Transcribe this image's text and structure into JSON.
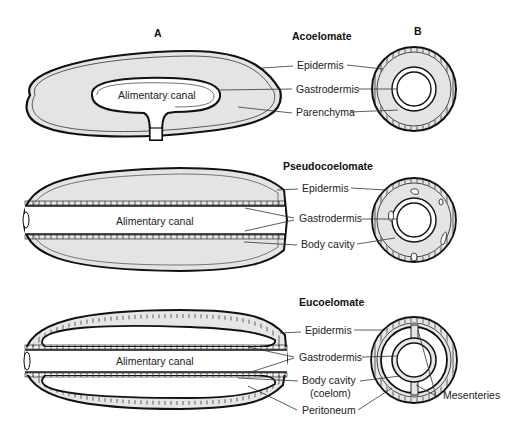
{
  "columns": {
    "a": "A",
    "b": "B"
  },
  "panels": [
    {
      "title": "Acoelomate",
      "canal_label": "Alimentary canal",
      "labels": [
        "Epidermis",
        "Gastrodermis",
        "Parenchyma"
      ]
    },
    {
      "title": "Pseudocoelomate",
      "canal_label": "Alimentary canal",
      "labels": [
        "Epidermis",
        "Gastrodermis",
        "Body cavity"
      ]
    },
    {
      "title": "Eucoelomate",
      "canal_label": "Alimentary canal",
      "labels": [
        "Epidermis",
        "Gastrodermis",
        "Body cavity",
        "(coelom)",
        "Peritoneum"
      ],
      "extra_label": "Mesenteries"
    }
  ],
  "colors": {
    "fill": "#e6e6e6",
    "stroke": "#111111",
    "background": "#ffffff"
  }
}
